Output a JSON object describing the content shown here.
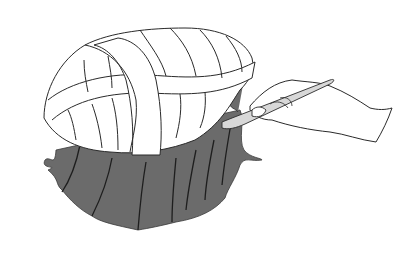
{
  "illustration": {
    "subject": "hand holding scalpel trimming a wrapped dome-shaped form over draped dark material",
    "colors": {
      "background": "#ffffff",
      "line": "#2a2a2a",
      "fabric": "#6b6b6b",
      "fabric_line": "#1e1e1e",
      "blade": "#d8d8d8",
      "fill_light": "#ffffff"
    }
  }
}
